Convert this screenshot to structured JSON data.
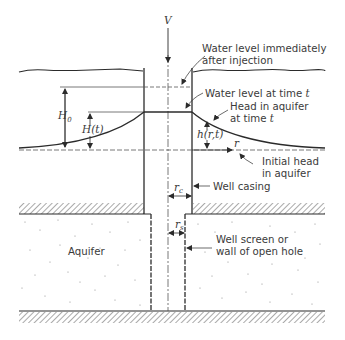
{
  "figure": {
    "labels": {
      "injection_volume": "V",
      "water_level_immediate_l1": "Water level immediately",
      "water_level_immediate_l2": "after injection",
      "water_level_time_t": "Water level at time ",
      "water_level_time_t_var": "t",
      "head_in_aquifer_l1": "Head in aquifer",
      "head_in_aquifer_l2": "at time ",
      "head_in_aquifer_l2_var": "t",
      "initial_head_l1": "Initial head",
      "initial_head_l2": "in aquifer",
      "well_casing": "Well casing",
      "well_screen_l1": "Well screen or",
      "well_screen_l2": "wall of open hole",
      "aquifer": "Aquifer",
      "H0_main": "H",
      "H0_sub": "0",
      "Ht": "H(t)",
      "hrt": "h(r,t)",
      "r": "r",
      "rc_main": "r",
      "rc_sub": "c",
      "rs_main": "r",
      "rs_sub": "s"
    },
    "colors": {
      "line": "#2b2b2b",
      "text": "#3a3a3a",
      "hatch": "#555555",
      "dots": "#8a8a8a",
      "background": "#ffffff"
    }
  }
}
